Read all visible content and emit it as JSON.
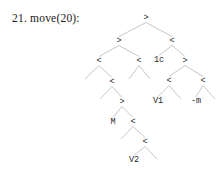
{
  "caption": {
    "index": "21.",
    "text": "move(20):",
    "full": "21.  move(20):"
  },
  "colors": {
    "background": "#ffffff",
    "edge": "#b0b0b0",
    "text": "#1a1a1a",
    "node_text": "#2a2a2a"
  },
  "tree": {
    "description": "binary derivation tree",
    "nodes": [
      {
        "id": "n0",
        "label": ">",
        "x": 146,
        "y": 18,
        "kind": "internal"
      },
      {
        "id": "n1",
        "label": ">",
        "x": 119,
        "y": 41,
        "kind": "internal"
      },
      {
        "id": "n2",
        "label": "<",
        "x": 172,
        "y": 41,
        "kind": "internal"
      },
      {
        "id": "n3",
        "label": "<",
        "x": 99,
        "y": 61,
        "kind": "internal"
      },
      {
        "id": "n4",
        "label": "<",
        "x": 139,
        "y": 61,
        "kind": "internal"
      },
      {
        "id": "n5",
        "label": "1c",
        "x": 159,
        "y": 60,
        "kind": "leaf"
      },
      {
        "id": "n6",
        "label": ">",
        "x": 185,
        "y": 61,
        "kind": "internal"
      },
      {
        "id": "n7",
        "label": "<",
        "x": 112,
        "y": 82,
        "kind": "internal"
      },
      {
        "id": "n8",
        "label": "<",
        "x": 169,
        "y": 81,
        "kind": "internal"
      },
      {
        "id": "n9",
        "label": "<",
        "x": 203,
        "y": 81,
        "kind": "internal"
      },
      {
        "id": "n10",
        "label": "V1",
        "x": 158,
        "y": 101,
        "kind": "leaf"
      },
      {
        "id": "n11",
        "label": "-m",
        "x": 196,
        "y": 101,
        "kind": "leaf"
      },
      {
        "id": "n12",
        "label": ">",
        "x": 122,
        "y": 102,
        "kind": "internal"
      },
      {
        "id": "n13",
        "label": "M",
        "x": 113,
        "y": 122,
        "kind": "leaf"
      },
      {
        "id": "n14",
        "label": "<",
        "x": 133,
        "y": 122,
        "kind": "internal"
      },
      {
        "id": "n15",
        "label": "<",
        "x": 145,
        "y": 142,
        "kind": "internal"
      },
      {
        "id": "n16",
        "label": "V2",
        "x": 134,
        "y": 160,
        "kind": "leaf"
      }
    ],
    "edges": [
      {
        "from": "n0",
        "to": "n1"
      },
      {
        "from": "n0",
        "to": "n2"
      },
      {
        "from": "n1",
        "to": "n3"
      },
      {
        "from": "n1",
        "to": "n4"
      },
      {
        "from": "n2",
        "to": "n5"
      },
      {
        "from": "n2",
        "to": "n6"
      },
      {
        "from": "n3",
        "to": "n7"
      },
      {
        "from": "n4",
        "to": "n4L"
      },
      {
        "from": "n4",
        "to": "n4R"
      },
      {
        "from": "n6",
        "to": "n8"
      },
      {
        "from": "n6",
        "to": "n9"
      },
      {
        "from": "n8",
        "to": "n10"
      },
      {
        "from": "n8",
        "to": "n8R"
      },
      {
        "from": "n9",
        "to": "n11"
      },
      {
        "from": "n9",
        "to": "n9R"
      },
      {
        "from": "n3",
        "to": "n3L"
      },
      {
        "from": "n7",
        "to": "n7L"
      },
      {
        "from": "n7",
        "to": "n12"
      },
      {
        "from": "n12",
        "to": "n13"
      },
      {
        "from": "n12",
        "to": "n14"
      },
      {
        "from": "n14",
        "to": "n14L"
      },
      {
        "from": "n14",
        "to": "n15"
      },
      {
        "from": "n15",
        "to": "n16"
      },
      {
        "from": "n15",
        "to": "n15R"
      }
    ],
    "stub_endpoints": [
      {
        "id": "n3L",
        "x": 85,
        "y": 79
      },
      {
        "id": "n4L",
        "x": 129,
        "y": 79
      },
      {
        "id": "n4R",
        "x": 150,
        "y": 79
      },
      {
        "id": "n7L",
        "x": 100,
        "y": 99
      },
      {
        "id": "n8R",
        "x": 181,
        "y": 99
      },
      {
        "id": "n9R",
        "x": 215,
        "y": 99
      },
      {
        "id": "n14L",
        "x": 121,
        "y": 139
      },
      {
        "id": "n15R",
        "x": 157,
        "y": 159
      }
    ],
    "labels_visible": [
      ">",
      ">",
      "<",
      "<",
      "<",
      "1c",
      ">",
      "<",
      "<",
      "<",
      "V1",
      "-m",
      ">",
      "M",
      "<",
      "<",
      "V2"
    ]
  }
}
